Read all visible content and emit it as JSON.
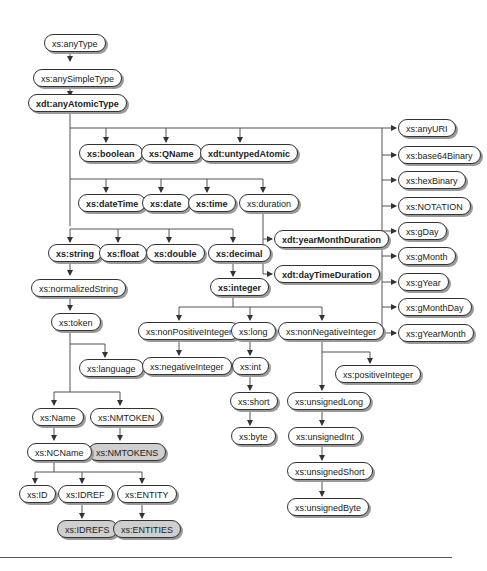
{
  "diagram": {
    "nodes": [
      {
        "id": "anyType",
        "label": "xs:anyType",
        "style": "normal"
      },
      {
        "id": "anySimpleType",
        "label": "xs:anySimpleType",
        "style": "normal"
      },
      {
        "id": "anyAtomicType",
        "label": "xdt:anyAtomicType",
        "style": "bold"
      },
      {
        "id": "boolean",
        "label": "xs:boolean",
        "style": "bold"
      },
      {
        "id": "QName",
        "label": "xs:QName",
        "style": "bold"
      },
      {
        "id": "untypedAtomic",
        "label": "xdt:untypedAtomic",
        "style": "bold"
      },
      {
        "id": "dateTime",
        "label": "xs:dateTime",
        "style": "bold"
      },
      {
        "id": "date",
        "label": "xs:date",
        "style": "bold"
      },
      {
        "id": "time",
        "label": "xs:time",
        "style": "bold"
      },
      {
        "id": "duration",
        "label": "xs:duration",
        "style": "normal"
      },
      {
        "id": "yearMonthDuration",
        "label": "xdt:yearMonthDuration",
        "style": "bold"
      },
      {
        "id": "dayTimeDuration",
        "label": "xdt:dayTimeDuration",
        "style": "bold"
      },
      {
        "id": "string",
        "label": "xs:string",
        "style": "bold"
      },
      {
        "id": "float",
        "label": "xs:float",
        "style": "bold"
      },
      {
        "id": "double",
        "label": "xs:double",
        "style": "bold"
      },
      {
        "id": "decimal",
        "label": "xs:decimal",
        "style": "bold"
      },
      {
        "id": "integer",
        "label": "xs:integer",
        "style": "bold"
      },
      {
        "id": "normalizedString",
        "label": "xs:normalizedString",
        "style": "normal"
      },
      {
        "id": "token",
        "label": "xs:token",
        "style": "normal"
      },
      {
        "id": "language",
        "label": "xs:language",
        "style": "normal"
      },
      {
        "id": "Name",
        "label": "xs:Name",
        "style": "normal"
      },
      {
        "id": "NMTOKEN",
        "label": "xs:NMTOKEN",
        "style": "normal"
      },
      {
        "id": "NMTOKENS",
        "label": "xs:NMTOKENS",
        "style": "grey"
      },
      {
        "id": "NCName",
        "label": "xs:NCName",
        "style": "normal"
      },
      {
        "id": "ID",
        "label": "xs:ID",
        "style": "normal"
      },
      {
        "id": "IDREF",
        "label": "xs:IDREF",
        "style": "normal"
      },
      {
        "id": "ENTITY",
        "label": "xs:ENTITY",
        "style": "normal"
      },
      {
        "id": "IDREFS",
        "label": "xs:IDREFS",
        "style": "grey"
      },
      {
        "id": "ENTITIES",
        "label": "xs:ENTITIES",
        "style": "grey"
      },
      {
        "id": "nonPositiveInteger",
        "label": "xs:nonPositiveInteger",
        "style": "normal"
      },
      {
        "id": "negativeInteger",
        "label": "xs:negativeInteger",
        "style": "normal"
      },
      {
        "id": "long",
        "label": "xs:long",
        "style": "normal"
      },
      {
        "id": "int",
        "label": "xs:int",
        "style": "normal"
      },
      {
        "id": "short",
        "label": "xs:short",
        "style": "normal"
      },
      {
        "id": "byte",
        "label": "xs:byte",
        "style": "normal"
      },
      {
        "id": "nonNegativeInteger",
        "label": "xs:nonNegativeInteger",
        "style": "normal"
      },
      {
        "id": "positiveInteger",
        "label": "xs:positiveInteger",
        "style": "normal"
      },
      {
        "id": "unsignedLong",
        "label": "xs:unsignedLong",
        "style": "normal"
      },
      {
        "id": "unsignedInt",
        "label": "xs:unsignedInt",
        "style": "normal"
      },
      {
        "id": "unsignedShort",
        "label": "xs:unsignedShort",
        "style": "normal"
      },
      {
        "id": "unsignedByte",
        "label": "xs:unsignedByte",
        "style": "normal"
      },
      {
        "id": "anyURI",
        "label": "xs:anyURI",
        "style": "normal"
      },
      {
        "id": "base64Binary",
        "label": "xs:base64Binary",
        "style": "normal"
      },
      {
        "id": "hexBinary",
        "label": "xs:hexBinary",
        "style": "normal"
      },
      {
        "id": "NOTATION",
        "label": "xs:NOTATION",
        "style": "normal"
      },
      {
        "id": "gDay",
        "label": "xs:gDay",
        "style": "normal"
      },
      {
        "id": "gMonth",
        "label": "xs:gMonth",
        "style": "normal"
      },
      {
        "id": "gYear",
        "label": "xs:gYear",
        "style": "normal"
      },
      {
        "id": "gMonthDay",
        "label": "xs:gMonthDay",
        "style": "normal"
      },
      {
        "id": "gYearMonth",
        "label": "xs:gYearMonth",
        "style": "normal"
      }
    ],
    "edges": [
      [
        "anyType",
        "anySimpleType"
      ],
      [
        "anySimpleType",
        "anyAtomicType"
      ],
      [
        "anyAtomicType",
        "boolean"
      ],
      [
        "anyAtomicType",
        "QName"
      ],
      [
        "anyAtomicType",
        "untypedAtomic"
      ],
      [
        "anyAtomicType",
        "dateTime"
      ],
      [
        "anyAtomicType",
        "date"
      ],
      [
        "anyAtomicType",
        "time"
      ],
      [
        "anyAtomicType",
        "duration"
      ],
      [
        "duration",
        "yearMonthDuration"
      ],
      [
        "duration",
        "dayTimeDuration"
      ],
      [
        "anyAtomicType",
        "string"
      ],
      [
        "anyAtomicType",
        "float"
      ],
      [
        "anyAtomicType",
        "double"
      ],
      [
        "anyAtomicType",
        "decimal"
      ],
      [
        "decimal",
        "integer"
      ],
      [
        "string",
        "normalizedString"
      ],
      [
        "normalizedString",
        "token"
      ],
      [
        "token",
        "language"
      ],
      [
        "token",
        "Name"
      ],
      [
        "token",
        "NMTOKEN"
      ],
      [
        "NMTOKEN",
        "NMTOKENS"
      ],
      [
        "Name",
        "NCName"
      ],
      [
        "NCName",
        "ID"
      ],
      [
        "NCName",
        "IDREF"
      ],
      [
        "NCName",
        "ENTITY"
      ],
      [
        "IDREF",
        "IDREFS"
      ],
      [
        "ENTITY",
        "ENTITIES"
      ],
      [
        "integer",
        "nonPositiveInteger"
      ],
      [
        "nonPositiveInteger",
        "negativeInteger"
      ],
      [
        "integer",
        "long"
      ],
      [
        "long",
        "int"
      ],
      [
        "int",
        "short"
      ],
      [
        "short",
        "byte"
      ],
      [
        "integer",
        "nonNegativeInteger"
      ],
      [
        "nonNegativeInteger",
        "positiveInteger"
      ],
      [
        "nonNegativeInteger",
        "unsignedLong"
      ],
      [
        "unsignedLong",
        "unsignedInt"
      ],
      [
        "unsignedInt",
        "unsignedShort"
      ],
      [
        "unsignedShort",
        "unsignedByte"
      ],
      [
        "anyAtomicType",
        "anyURI"
      ],
      [
        "anyAtomicType",
        "base64Binary"
      ],
      [
        "anyAtomicType",
        "hexBinary"
      ],
      [
        "anyAtomicType",
        "NOTATION"
      ],
      [
        "anyAtomicType",
        "gDay"
      ],
      [
        "anyAtomicType",
        "gMonth"
      ],
      [
        "anyAtomicType",
        "gYear"
      ],
      [
        "anyAtomicType",
        "gMonthDay"
      ],
      [
        "anyAtomicType",
        "gYearMonth"
      ]
    ]
  }
}
